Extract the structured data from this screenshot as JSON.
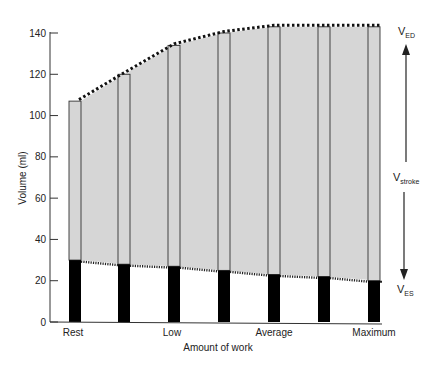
{
  "chart_data": {
    "type": "bar",
    "title": "",
    "xlabel": "Amount of work",
    "ylabel": "Volume (ml)",
    "ylim": [
      0,
      140
    ],
    "yticks": [
      0,
      20,
      40,
      60,
      80,
      100,
      120,
      140
    ],
    "xtick_labels": [
      "Rest",
      "Low",
      "Average",
      "Maximum"
    ],
    "grid": false,
    "legend": null,
    "series": [
      {
        "name": "End-systolic volume (VES)",
        "values": [
          30,
          28,
          27,
          25,
          23,
          22,
          20
        ],
        "color": "#000000"
      },
      {
        "name": "End-diastolic volume (VED)",
        "values": [
          107,
          120,
          134,
          140,
          143,
          143,
          143
        ],
        "color": "#d6d6d6"
      },
      {
        "name": "Stroke volume (Vstroke)",
        "values": [
          77,
          92,
          107,
          115,
          120,
          121,
          123
        ]
      }
    ],
    "annotations": [
      {
        "text": "V",
        "sub": "ED",
        "position": "top-right"
      },
      {
        "text": "V",
        "sub": "stroke",
        "position": "middle-right"
      },
      {
        "text": "V",
        "sub": "ES",
        "position": "bottom-right"
      }
    ],
    "fill_color": "#d6d6d6"
  },
  "labels": {
    "ylabel": "Volume (ml)",
    "xlabel": "Amount of work",
    "ved_main": "V",
    "ved_sub": "ED",
    "vstroke_main": "V",
    "vstroke_sub": "stroke",
    "ves_main": "V",
    "ves_sub": "ES"
  }
}
